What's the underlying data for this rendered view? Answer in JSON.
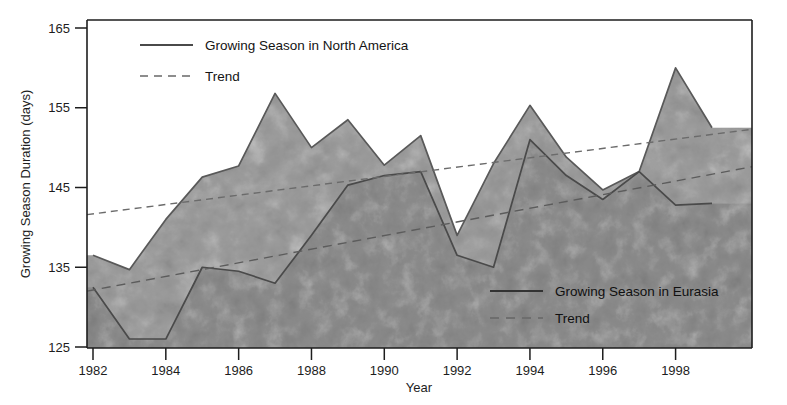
{
  "chart_data": {
    "type": "area",
    "title": "",
    "xlabel": "Year",
    "ylabel": "Growing Season Duration (days)",
    "xlim": [
      1982,
      1999
    ],
    "ylim": [
      125,
      165
    ],
    "yticks": [
      "125",
      "135",
      "145",
      "155",
      "165"
    ],
    "xticks": [
      "1982",
      "1984",
      "1986",
      "1988",
      "1990",
      "1992",
      "1994",
      "1996",
      "1998"
    ],
    "grid": false,
    "x": [
      1982,
      1983,
      1984,
      1985,
      1986,
      1987,
      1988,
      1989,
      1990,
      1991,
      1992,
      1993,
      1994,
      1995,
      1996,
      1997,
      1998,
      1999
    ],
    "series": [
      {
        "name": "Growing Season in North America",
        "values": [
          136.5,
          134.7,
          141.0,
          146.3,
          147.7,
          156.8,
          150.0,
          153.5,
          147.8,
          151.5,
          139.0,
          148.0,
          155.3,
          148.8,
          144.7,
          147.0,
          160.0,
          152.5
        ],
        "color": "#595959",
        "fill": "#9a9a9a",
        "style": "solid"
      },
      {
        "name": "Growing Season in Eurasia",
        "values": [
          132.5,
          126.0,
          126.0,
          135.0,
          134.5,
          133.0,
          139.0,
          145.3,
          146.5,
          147.0,
          136.5,
          135.0,
          151.0,
          146.5,
          143.5,
          147.0,
          142.8,
          143.0
        ],
        "color": "#4a4a4a",
        "fill": "#8a8a8a",
        "style": "solid"
      }
    ],
    "trends": [
      {
        "name": "Trend",
        "of": "Growing Season in North America",
        "start_value": 141.6,
        "end_value": 152.3,
        "color": "#6b6b6b",
        "style": "dashed"
      },
      {
        "name": "Trend",
        "of": "Growing Season in Eurasia",
        "start_value": 132.0,
        "end_value": 147.6,
        "color": "#5c5c5c",
        "style": "dashed"
      }
    ]
  },
  "axis": {
    "y_title": "Growing Season Duration (days)",
    "x_title": "Year",
    "y_ticks": [
      "165",
      "155",
      "145",
      "135",
      "125"
    ],
    "x_ticks": [
      "1982",
      "1984",
      "1986",
      "1988",
      "1990",
      "1992",
      "1994",
      "1996",
      "1998"
    ]
  },
  "legend_top": {
    "series_label": "Growing Season in North America",
    "trend_label": "Trend"
  },
  "legend_bottom": {
    "series_label": "Growing Season in Eurasia",
    "trend_label": "Trend"
  },
  "colors": {
    "axis": "#1d1d1d",
    "na_line": "#595959",
    "na_fill": "#9a9a9a",
    "eu_line": "#4a4a4a",
    "eu_fill": "#8a8a8a",
    "background": "#ffffff"
  }
}
